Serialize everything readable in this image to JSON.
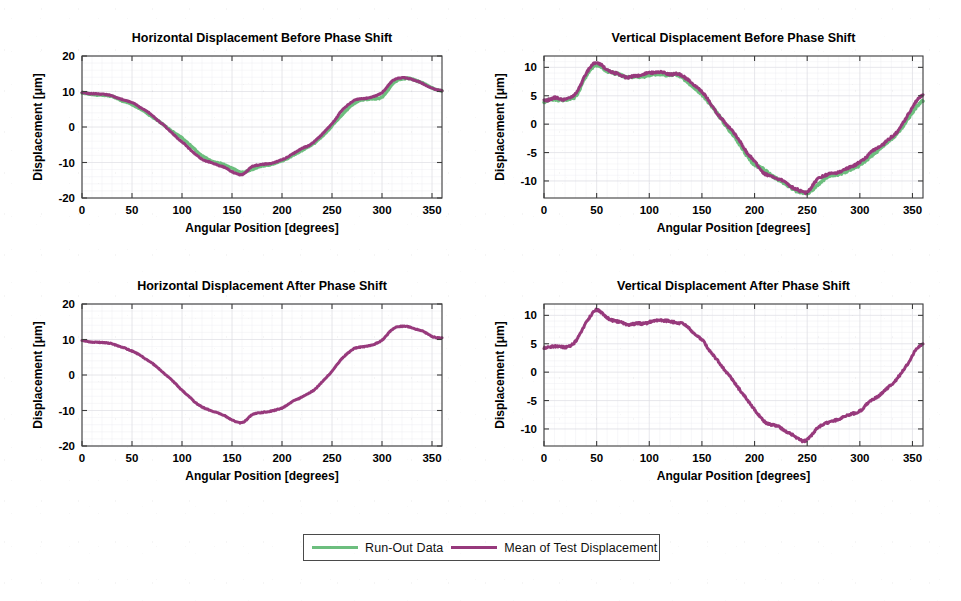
{
  "figure": {
    "width": 961,
    "height": 601,
    "background": "#ffffff",
    "colors": {
      "run_out": "#6CBE7E",
      "mean_test": "#97397C",
      "axis": "#3d3d3d",
      "grid": "#dcdce2",
      "text": "#000000"
    }
  },
  "legend": {
    "entries": [
      {
        "label": "Run-Out Data",
        "color": "#6CBE7E",
        "marker": "line"
      },
      {
        "label": "Mean of Test Displacement",
        "color": "#97397C",
        "marker": "line"
      }
    ],
    "position": "bottom-center",
    "border": true
  },
  "chart_data": [
    {
      "id": "horizontal-before",
      "type": "line",
      "title": "Horizontal Displacement Before Phase Shift",
      "xlabel": "Angular Position [degrees]",
      "ylabel": "Displacement [μm]",
      "xlim": [
        0,
        360
      ],
      "ylim": [
        -20,
        20
      ],
      "xticks": [
        0,
        50,
        100,
        150,
        200,
        250,
        300,
        350
      ],
      "yticks": [
        -20,
        -10,
        0,
        10,
        20
      ],
      "grid": true,
      "legend_position": "external-bottom",
      "x": [
        0,
        10,
        20,
        30,
        40,
        50,
        60,
        70,
        80,
        90,
        100,
        110,
        120,
        130,
        140,
        150,
        160,
        170,
        180,
        190,
        200,
        210,
        220,
        230,
        240,
        250,
        260,
        270,
        280,
        290,
        300,
        310,
        320,
        330,
        340,
        350,
        360
      ],
      "series": [
        {
          "name": "Run-Out Data",
          "color": "#6CBE7E",
          "values": [
            9.6,
            9.2,
            9.0,
            8.6,
            7.4,
            6.3,
            4.7,
            3.0,
            0.9,
            -1.2,
            -3.1,
            -5.6,
            -8.0,
            -9.6,
            -10.4,
            -11.6,
            -12.8,
            -11.9,
            -11.0,
            -10.4,
            -9.6,
            -8.2,
            -6.6,
            -5.0,
            -2.6,
            0.3,
            3.4,
            6.2,
            7.6,
            8.0,
            8.5,
            11.9,
            13.6,
            13.4,
            12.5,
            11.0,
            10.2
          ]
        },
        {
          "name": "Mean of Test Displacement",
          "color": "#97397C",
          "values": [
            9.7,
            9.3,
            9.2,
            8.8,
            7.8,
            6.8,
            5.2,
            3.3,
            1.0,
            -1.6,
            -4.2,
            -6.9,
            -9.0,
            -10.1,
            -11.1,
            -12.6,
            -13.5,
            -11.2,
            -10.6,
            -10.1,
            -9.3,
            -7.6,
            -6.1,
            -4.6,
            -2.0,
            1.1,
            4.6,
            7.1,
            7.9,
            8.4,
            9.8,
            12.8,
            13.8,
            13.3,
            12.4,
            10.9,
            10.4
          ]
        }
      ]
    },
    {
      "id": "vertical-before",
      "type": "line",
      "title": "Vertical Displacement Before Phase Shift",
      "xlabel": "Angular Position [degrees]",
      "ylabel": "Displacement [μm]",
      "xlim": [
        0,
        360
      ],
      "ylim": [
        -13,
        12
      ],
      "xticks": [
        0,
        50,
        100,
        150,
        200,
        250,
        300,
        350
      ],
      "yticks": [
        -10,
        -5,
        0,
        5,
        10
      ],
      "grid": true,
      "legend_position": "external-bottom",
      "x": [
        0,
        10,
        20,
        30,
        40,
        50,
        60,
        70,
        80,
        90,
        100,
        110,
        120,
        130,
        140,
        150,
        160,
        170,
        180,
        190,
        200,
        210,
        220,
        230,
        240,
        250,
        260,
        270,
        280,
        290,
        300,
        310,
        320,
        330,
        340,
        350,
        360
      ],
      "series": [
        {
          "name": "Run-Out Data",
          "color": "#6CBE7E",
          "values": [
            4.0,
            4.3,
            4.2,
            5.0,
            8.4,
            10.4,
            9.4,
            8.8,
            8.3,
            8.3,
            8.6,
            8.9,
            8.7,
            8.4,
            6.9,
            5.2,
            2.9,
            0.4,
            -2.0,
            -4.8,
            -7.0,
            -8.2,
            -9.4,
            -10.6,
            -11.8,
            -12.1,
            -10.6,
            -9.3,
            -8.7,
            -8.2,
            -7.2,
            -5.8,
            -4.2,
            -2.6,
            -0.5,
            2.0,
            4.2
          ]
        },
        {
          "name": "Mean of Test Displacement",
          "color": "#97397C",
          "values": [
            4.2,
            4.6,
            4.4,
            5.4,
            8.8,
            10.9,
            9.6,
            8.8,
            8.4,
            8.6,
            8.9,
            9.1,
            8.8,
            8.6,
            7.4,
            5.7,
            3.1,
            0.7,
            -1.5,
            -4.2,
            -6.5,
            -8.8,
            -9.4,
            -10.4,
            -11.6,
            -12.0,
            -9.6,
            -8.9,
            -8.3,
            -7.6,
            -6.8,
            -5.0,
            -3.8,
            -2.3,
            -0.1,
            3.0,
            5.1
          ]
        }
      ]
    },
    {
      "id": "horizontal-after",
      "type": "line",
      "title": "Horizontal Displacement After Phase Shift",
      "xlabel": "Angular Position [degrees]",
      "ylabel": "Displacement [μm]",
      "xlim": [
        0,
        360
      ],
      "ylim": [
        -20,
        20
      ],
      "xticks": [
        0,
        50,
        100,
        150,
        200,
        250,
        300,
        350
      ],
      "yticks": [
        -20,
        -10,
        0,
        10,
        20
      ],
      "grid": true,
      "legend_position": "external-bottom",
      "x": [
        0,
        10,
        20,
        30,
        40,
        50,
        60,
        70,
        80,
        90,
        100,
        110,
        120,
        130,
        140,
        150,
        160,
        170,
        180,
        190,
        200,
        210,
        220,
        230,
        240,
        250,
        260,
        270,
        280,
        290,
        300,
        310,
        320,
        330,
        340,
        350,
        360
      ],
      "series": [
        {
          "name": "Mean of Test Displacement",
          "color": "#97397C",
          "values": [
            9.7,
            9.3,
            9.2,
            8.8,
            7.8,
            6.8,
            5.2,
            3.3,
            1.0,
            -1.6,
            -4.2,
            -6.9,
            -9.0,
            -10.1,
            -11.1,
            -12.6,
            -13.5,
            -11.2,
            -10.6,
            -10.1,
            -9.3,
            -7.6,
            -6.1,
            -4.6,
            -2.0,
            1.1,
            4.6,
            7.1,
            7.9,
            8.4,
            9.8,
            12.8,
            13.8,
            13.3,
            12.4,
            10.9,
            10.4
          ]
        }
      ]
    },
    {
      "id": "vertical-after",
      "type": "line",
      "title": "Vertical Displacement After Phase Shift",
      "xlabel": "Angular Position [degrees]",
      "ylabel": "Displacement [μm]",
      "xlim": [
        0,
        360
      ],
      "ylim": [
        -13,
        12
      ],
      "xticks": [
        0,
        50,
        100,
        150,
        200,
        250,
        300,
        350
      ],
      "yticks": [
        -10,
        -5,
        0,
        5,
        10
      ],
      "grid": true,
      "legend_position": "external-bottom",
      "x": [
        0,
        10,
        20,
        30,
        40,
        50,
        60,
        70,
        80,
        90,
        100,
        110,
        120,
        130,
        140,
        150,
        160,
        170,
        180,
        190,
        200,
        210,
        220,
        230,
        240,
        250,
        260,
        270,
        280,
        290,
        300,
        310,
        320,
        330,
        340,
        350,
        360
      ],
      "series": [
        {
          "name": "Mean of Test Displacement",
          "color": "#97397C",
          "values": [
            4.2,
            4.6,
            4.4,
            5.4,
            8.8,
            10.9,
            9.6,
            8.8,
            8.4,
            8.6,
            8.9,
            9.1,
            8.8,
            8.6,
            7.4,
            5.7,
            3.1,
            0.7,
            -1.5,
            -4.2,
            -6.5,
            -8.8,
            -9.4,
            -10.4,
            -11.6,
            -12.0,
            -9.6,
            -8.9,
            -8.3,
            -7.6,
            -6.8,
            -5.0,
            -3.8,
            -2.3,
            -0.1,
            3.0,
            5.1
          ]
        }
      ]
    }
  ]
}
